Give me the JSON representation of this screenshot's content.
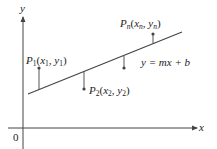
{
  "diagram": {
    "axes": {
      "x_label": "x",
      "y_label": "y",
      "origin_label": "0"
    },
    "line": {
      "equation": "y = mx + b"
    },
    "points": [
      {
        "id": "P1",
        "label": "P",
        "sub": "1",
        "coords_open": "(",
        "x": "x",
        "x_sub": "1",
        "sep": ", ",
        "y": "y",
        "y_sub": "1",
        "coords_close": ")",
        "position": "above line"
      },
      {
        "id": "P2",
        "label": "P",
        "sub": "2",
        "coords_open": "(",
        "x": "x",
        "x_sub": "2",
        "sep": ", ",
        "y": "y",
        "y_sub": "2",
        "coords_close": ")",
        "position": "below line"
      },
      {
        "id": "P3",
        "label": "",
        "position": "below line"
      },
      {
        "id": "Pn",
        "label": "P",
        "sub": "n",
        "coords_open": "(",
        "x": "x",
        "x_sub": "n",
        "sep": ", ",
        "y": "y",
        "y_sub": "n",
        "coords_close": ")",
        "position": "above line"
      }
    ],
    "colors": {
      "stroke": "#444444",
      "text": "#222222",
      "background": "#ffffff"
    }
  }
}
